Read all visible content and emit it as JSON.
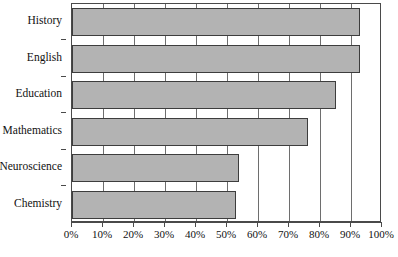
{
  "chart_data": {
    "type": "bar",
    "orientation": "horizontal",
    "title": "",
    "xlabel": "",
    "ylabel": "",
    "categories": [
      "History",
      "English",
      "Education",
      "Mathematics",
      "Neuroscience",
      "Chemistry"
    ],
    "values": [
      93,
      93,
      85,
      76,
      54,
      53
    ],
    "value_suffix": "%",
    "xlim": [
      0,
      100
    ],
    "xticks": [
      0,
      10,
      20,
      30,
      40,
      50,
      60,
      70,
      80,
      90,
      100
    ],
    "xtick_labels": [
      "0%",
      "10%",
      "20%",
      "30%",
      "40%",
      "50%",
      "60%",
      "70%",
      "80%",
      "90%",
      "100%"
    ],
    "grid": true,
    "grid_axis": "x",
    "legend": false,
    "legend_position": "none",
    "bar_fill_color": "#b3b3b3",
    "bar_edge_color": "#3d3d3d",
    "grid_color": "#6e6e6e",
    "axis_color": "#4a4a4a",
    "background_color": "#ffffff",
    "text_color": "#111111"
  }
}
